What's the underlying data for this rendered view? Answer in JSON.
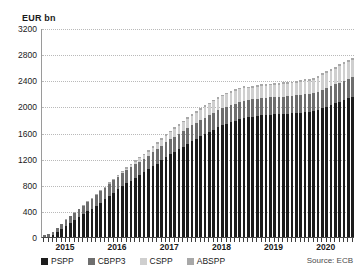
{
  "chart_data": {
    "type": "bar",
    "stacked": true,
    "title": "",
    "xlabel": "",
    "ylabel": "EUR bn",
    "ylim": [
      0,
      3200
    ],
    "ytick_step": 400,
    "yticks": [
      3200,
      2800,
      2400,
      2000,
      1600,
      1200,
      800,
      400,
      0
    ],
    "grid": true,
    "grid_style": "dotted-horizontal",
    "legend_position": "bottom",
    "source_note": "Source: ECB",
    "year_labels": [
      {
        "label": "2015",
        "index": 5
      },
      {
        "label": "2016",
        "index": 17
      },
      {
        "label": "2017",
        "index": 29
      },
      {
        "label": "2018",
        "index": 41
      },
      {
        "label": "2019",
        "index": 53
      },
      {
        "label": "2020",
        "index": 65
      }
    ],
    "categories": [
      "2015-01",
      "2015-02",
      "2015-03",
      "2015-04",
      "2015-05",
      "2015-06",
      "2015-07",
      "2015-08",
      "2015-09",
      "2015-10",
      "2015-11",
      "2015-12",
      "2016-01",
      "2016-02",
      "2016-03",
      "2016-04",
      "2016-05",
      "2016-06",
      "2016-07",
      "2016-08",
      "2016-09",
      "2016-10",
      "2016-11",
      "2016-12",
      "2017-01",
      "2017-02",
      "2017-03",
      "2017-04",
      "2017-05",
      "2017-06",
      "2017-07",
      "2017-08",
      "2017-09",
      "2017-10",
      "2017-11",
      "2017-12",
      "2018-01",
      "2018-02",
      "2018-03",
      "2018-04",
      "2018-05",
      "2018-06",
      "2018-07",
      "2018-08",
      "2018-09",
      "2018-10",
      "2018-11",
      "2018-12",
      "2019-01",
      "2019-02",
      "2019-03",
      "2019-04",
      "2019-05",
      "2019-06",
      "2019-07",
      "2019-08",
      "2019-09",
      "2019-10",
      "2019-11",
      "2019-12",
      "2020-01",
      "2020-02",
      "2020-03",
      "2020-04",
      "2020-05",
      "2020-06",
      "2020-07",
      "2020-08",
      "2020-09",
      "2020-10",
      "2020-11",
      "2020-12"
    ],
    "series": [
      {
        "name": "PSPP",
        "color": "#1c1c1c",
        "values": [
          0,
          0,
          26,
          73,
          120,
          170,
          215,
          255,
          300,
          347,
          392,
          435,
          480,
          528,
          575,
          628,
          678,
          728,
          775,
          820,
          862,
          905,
          950,
          990,
          1035,
          1080,
          1125,
          1175,
          1220,
          1265,
          1305,
          1345,
          1385,
          1425,
          1465,
          1500,
          1540,
          1575,
          1610,
          1645,
          1680,
          1710,
          1735,
          1760,
          1780,
          1800,
          1820,
          1835,
          1845,
          1855,
          1862,
          1868,
          1872,
          1876,
          1880,
          1884,
          1888,
          1892,
          1898,
          1905,
          1912,
          1918,
          1928,
          1948,
          1972,
          1998,
          2022,
          2048,
          2072,
          2098,
          2122,
          2145
        ]
      },
      {
        "name": "CBPP3",
        "color": "#6e6e6e",
        "values": [
          28,
          40,
          52,
          65,
          78,
          90,
          102,
          112,
          122,
          133,
          143,
          151,
          160,
          170,
          178,
          188,
          197,
          196,
          200,
          205,
          209,
          212,
          205,
          208,
          212,
          216,
          220,
          224,
          228,
          231,
          234,
          237,
          240,
          243,
          246,
          248,
          251,
          253,
          255,
          257,
          259,
          261,
          262,
          263,
          264,
          265,
          266,
          262,
          263,
          263,
          264,
          264,
          265,
          265,
          266,
          267,
          268,
          269,
          270,
          272,
          273,
          275,
          277,
          280,
          283,
          286,
          288,
          290,
          292,
          294,
          296,
          298
        ]
      },
      {
        "name": "CSPP",
        "color": "#cfcfcf",
        "values": [
          0,
          0,
          0,
          0,
          0,
          0,
          0,
          0,
          0,
          0,
          0,
          0,
          0,
          0,
          0,
          0,
          0,
          6,
          14,
          22,
          30,
          39,
          48,
          52,
          62,
          72,
          82,
          92,
          101,
          110,
          118,
          125,
          132,
          139,
          146,
          152,
          158,
          163,
          168,
          173,
          178,
          182,
          186,
          189,
          192,
          195,
          197,
          178,
          180,
          181,
          183,
          184,
          185,
          186,
          187,
          188,
          190,
          192,
          194,
          196,
          198,
          200,
          205,
          212,
          220,
          228,
          236,
          242,
          248,
          254,
          260,
          266
        ]
      },
      {
        "name": "ABSPP",
        "color": "#a8a8a8",
        "values": [
          3,
          5,
          6,
          7,
          8,
          9,
          10,
          11,
          12,
          13,
          14,
          15,
          16,
          17,
          18,
          19,
          19,
          20,
          20,
          21,
          21,
          22,
          22,
          23,
          23,
          24,
          24,
          24,
          25,
          25,
          25,
          25,
          26,
          26,
          26,
          26,
          27,
          27,
          27,
          27,
          28,
          28,
          28,
          28,
          28,
          28,
          28,
          28,
          28,
          28,
          28,
          28,
          28,
          28,
          28,
          28,
          28,
          28,
          28,
          29,
          29,
          29,
          30,
          30,
          30,
          30,
          30,
          30,
          30,
          30,
          30,
          30
        ]
      }
    ]
  },
  "legend": {
    "items": [
      {
        "label": "PSPP",
        "color": "#1c1c1c"
      },
      {
        "label": "CBPP3",
        "color": "#6e6e6e"
      },
      {
        "label": "CSPP",
        "color": "#cfcfcf"
      },
      {
        "label": "ABSPP",
        "color": "#a8a8a8"
      }
    ]
  },
  "source": {
    "text": "Source: ECB"
  }
}
